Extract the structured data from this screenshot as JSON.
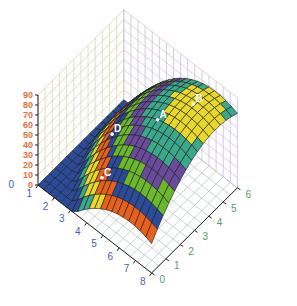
{
  "chart_data": {
    "type": "surface3d",
    "title": "",
    "xlabel": "",
    "ylabel": "",
    "zlabel": "",
    "x_ticks": [
      "1",
      "2",
      "3",
      "4",
      "5",
      "6",
      "7",
      "8"
    ],
    "y_ticks": [
      "0",
      "1",
      "2",
      "3",
      "4",
      "5",
      "6"
    ],
    "z_ticks": [
      "0",
      "10",
      "20",
      "30",
      "40",
      "50",
      "60",
      "70",
      "80",
      "90"
    ],
    "extra_label": "0",
    "xlim": [
      0,
      8
    ],
    "ylim": [
      0,
      6
    ],
    "zlim": [
      0,
      90
    ],
    "grid": true,
    "surface": {
      "description": "Dome-shaped surface peaking near x=6, y=4.5; z = 85 - 2.2*((x-6.5)^2) - 2.5*((y-4.5)^2) clipped to >= 0",
      "peak": {
        "x": 6.5,
        "y": 4.5,
        "z": 85
      },
      "kx": 2.2,
      "ky": 2.5
    },
    "color_bands": [
      {
        "from": 0,
        "to": 10,
        "color": "#2c4a9a"
      },
      {
        "from": 10,
        "to": 20,
        "color": "#3aa88a"
      },
      {
        "from": 20,
        "to": 30,
        "color": "#e8d82a"
      },
      {
        "from": 30,
        "to": 40,
        "color": "#e8601c"
      },
      {
        "from": 40,
        "to": 50,
        "color": "#2c4a9a"
      },
      {
        "from": 50,
        "to": 60,
        "color": "#6ab82c"
      },
      {
        "from": 60,
        "to": 70,
        "color": "#6a4a9a"
      },
      {
        "from": 70,
        "to": 80,
        "color": "#3aa88a"
      },
      {
        "from": 80,
        "to": 90,
        "color": "#e8d82a"
      }
    ],
    "points": [
      {
        "label": "A",
        "x": 5.2,
        "y": 3.2
      },
      {
        "label": "B",
        "x": 6.3,
        "y": 4.6
      },
      {
        "label": "C",
        "x": 3.6,
        "y": 0.9
      },
      {
        "label": "D",
        "x": 2.6,
        "y": 2.6
      }
    ]
  }
}
